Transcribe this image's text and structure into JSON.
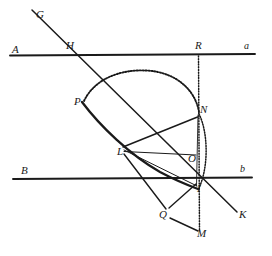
{
  "figure": {
    "type": "geometry-construction-diagram",
    "title": "",
    "background_color": "#ffffff",
    "ink_color": "#1a1a1a",
    "width": 272,
    "height": 256
  },
  "points": [
    {
      "id": "G",
      "label": "G",
      "x": 40,
      "y": 16,
      "kind": "ray-endpoint"
    },
    {
      "id": "A",
      "label": "A",
      "x": 16,
      "y": 51,
      "kind": "line-end-label"
    },
    {
      "id": "H",
      "label": "H",
      "x": 70,
      "y": 48,
      "kind": "intersection"
    },
    {
      "id": "R",
      "label": "R",
      "x": 199,
      "y": 47,
      "kind": "intersection"
    },
    {
      "id": "a",
      "label": "a",
      "x": 247,
      "y": 46,
      "kind": "line-name"
    },
    {
      "id": "P",
      "label": "P",
      "x": 78,
      "y": 103,
      "kind": "curve-point"
    },
    {
      "id": "N",
      "label": "N",
      "x": 203,
      "y": 111,
      "kind": "curve-point"
    },
    {
      "id": "L",
      "label": "L",
      "x": 121,
      "y": 152,
      "kind": "curve-point"
    },
    {
      "id": "O",
      "label": "O",
      "x": 192,
      "y": 159,
      "kind": "center"
    },
    {
      "id": "B",
      "label": "B",
      "x": 24,
      "y": 172,
      "kind": "line-end-label"
    },
    {
      "id": "b",
      "label": "b",
      "x": 242,
      "y": 170,
      "kind": "line-name"
    },
    {
      "id": "I",
      "label": "I",
      "x": 199,
      "y": 190,
      "kind": "intersection"
    },
    {
      "id": "Q",
      "label": "Q",
      "x": 164,
      "y": 216,
      "kind": "curve-point"
    },
    {
      "id": "K",
      "label": "K",
      "x": 242,
      "y": 216,
      "kind": "ray-endpoint"
    },
    {
      "id": "M",
      "label": "M",
      "x": 200,
      "y": 235,
      "kind": "ray-endpoint"
    }
  ],
  "lines": [
    {
      "id": "line-a",
      "name": "horizontal-line-a",
      "style": "solid-thick",
      "from": [
        10,
        55
      ],
      "to": [
        255,
        54
      ]
    },
    {
      "id": "line-b",
      "name": "horizontal-line-b",
      "style": "solid-thick",
      "from": [
        13,
        179
      ],
      "to": [
        252,
        177
      ]
    },
    {
      "id": "line-GK",
      "name": "transversal-G-to-K",
      "style": "solid",
      "from": [
        32,
        10
      ],
      "to": [
        237,
        212
      ]
    },
    {
      "id": "line-LN",
      "name": "segment-L-to-N",
      "style": "solid",
      "from": [
        122,
        146
      ],
      "to": [
        197,
        117
      ]
    },
    {
      "id": "line-LO",
      "name": "segment-L-to-O",
      "style": "solid-thin",
      "from": [
        124,
        152
      ],
      "to": [
        196,
        155
      ]
    },
    {
      "id": "line-LQ",
      "name": "segment-L-to-Q",
      "style": "solid",
      "from": [
        124,
        154
      ],
      "to": [
        166,
        209
      ]
    },
    {
      "id": "line-QI",
      "name": "segment-Q-to-I",
      "style": "solid",
      "from": [
        168,
        209
      ],
      "to": [
        196,
        185
      ]
    },
    {
      "id": "line-QM",
      "name": "segment-Q-to-M",
      "style": "solid",
      "from": [
        169,
        217
      ],
      "to": [
        198,
        231
      ]
    },
    {
      "id": "line-LI",
      "name": "segment-L-to-I",
      "style": "solid-thin",
      "from": [
        124,
        151
      ],
      "to": [
        197,
        186
      ]
    },
    {
      "id": "line-NI",
      "name": "segment-N-to-I",
      "style": "solid-thin",
      "from": [
        199,
        115
      ],
      "to": [
        197,
        186
      ]
    }
  ],
  "dotted_lines": [
    {
      "id": "dotted-RM",
      "name": "vertical-dotted-axis-R-N-O-I-M",
      "style": "dotted",
      "from": [
        198,
        56
      ],
      "to": [
        199,
        231
      ]
    }
  ],
  "curves": [
    {
      "id": "arc-PN",
      "name": "dotted-arc-P-over-top-to-N",
      "style": "dotted",
      "note": "arc from P rising over top and descending to N"
    },
    {
      "id": "curve-PLI",
      "name": "solid-curve-P-through-L-to-I",
      "style": "solid-thick",
      "note": "concave curve from P through L down to I"
    },
    {
      "id": "arc-NI",
      "name": "small-arc-N-to-I",
      "style": "dotted",
      "note": "short arc bulging right, N down to I"
    }
  ],
  "labels_order": [
    "G",
    "A",
    "H",
    "R",
    "a",
    "P",
    "N",
    "L",
    "O",
    "B",
    "b",
    "I",
    "Q",
    "K",
    "M"
  ]
}
